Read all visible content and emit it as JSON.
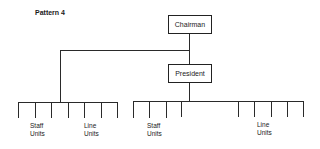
{
  "title": "Pattern 4",
  "nodes": {
    "chairman": "Chairman",
    "president": "President"
  },
  "groups": {
    "left": {
      "staff_l1": "Staff",
      "staff_l2": "Units",
      "line_l1": "Line",
      "line_l2": "Units"
    },
    "right": {
      "staff_l1": "Staff",
      "staff_l2": "Units",
      "line_l1": "Line",
      "line_l2": "Units"
    }
  },
  "colors": {
    "line": "#2a2a2a",
    "background": "#ffffff"
  }
}
